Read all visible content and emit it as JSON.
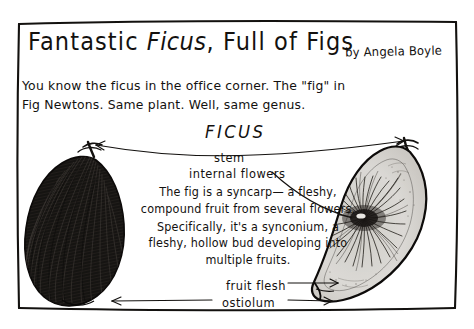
{
  "poster": {
    "title_prefix": "Fantastic ",
    "title_italic": "Ficus",
    "title_suffix": ", Full of Figs",
    "byline": "by Angela Boyle",
    "intro": "You know the ficus in the office corner. The \"fig\" in\nFig Newtons. Same plant. Well, same genus.",
    "genus_label": "FICUS",
    "body_paragraph": "The fig is a syncarp— a fleshy, compound fruit from several flowers. Specifically, it's a synconium, a fleshy, hollow bud developing into multiple fruits.",
    "labels": {
      "stem": "stem",
      "internal_flowers": "internal flowers",
      "fruit_flesh": "fruit flesh",
      "ostiolum": "ostiolum"
    },
    "colors": {
      "ink": "#13110f",
      "paper": "#ffffff",
      "fig_cut_fill": "#d8d6d2",
      "fig_whole_fill": "#1c1a18"
    },
    "figures": {
      "left": "whole-fig-illustration",
      "right": "fig-cross-section-illustration"
    }
  }
}
